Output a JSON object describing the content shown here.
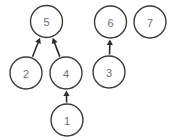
{
  "diagram": {
    "canvas": {
      "width": 173,
      "height": 140,
      "background": "#ffffff"
    },
    "style": {
      "node_stroke": "#3a3a3a",
      "node_fill": "#ffffff",
      "node_stroke_width": 1.4,
      "node_radius": 16,
      "label_color": "#6e6e6e",
      "label_font_size": 11,
      "edge_color": "#2b2b2b",
      "edge_stroke_width": 1.6,
      "arrow_size": 5.5
    },
    "nodes": [
      {
        "id": "5",
        "label": "5",
        "cx": 46.5,
        "cy": 21.5,
        "r": 16
      },
      {
        "id": "6",
        "label": "6",
        "cx": 110.5,
        "cy": 22.0,
        "r": 16
      },
      {
        "id": "7",
        "label": "7",
        "cx": 150.0,
        "cy": 22.0,
        "r": 16
      },
      {
        "id": "2",
        "label": "2",
        "cx": 26.0,
        "cy": 73.0,
        "r": 16
      },
      {
        "id": "4",
        "label": "4",
        "cx": 66.0,
        "cy": 73.0,
        "r": 16
      },
      {
        "id": "3",
        "label": "3",
        "cx": 109.0,
        "cy": 72.0,
        "r": 16
      },
      {
        "id": "1",
        "label": "1",
        "cx": 67.0,
        "cy": 120.0,
        "r": 16
      }
    ],
    "edges": [
      {
        "id": "2-5",
        "from": "2",
        "to": "5",
        "directed": true,
        "arrow_at": "to"
      },
      {
        "id": "4-5",
        "from": "4",
        "to": "5",
        "directed": true,
        "arrow_at": "to"
      },
      {
        "id": "1-4",
        "from": "1",
        "to": "4",
        "directed": true,
        "arrow_at": "to"
      },
      {
        "id": "3-6",
        "from": "3",
        "to": "6",
        "directed": true,
        "arrow_at": "to"
      }
    ],
    "isolated_nodes": [
      "7"
    ]
  }
}
